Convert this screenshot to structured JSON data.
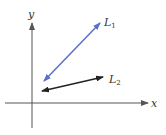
{
  "diagram": {
    "type": "coordinate-lines",
    "axes": {
      "x_label": "x",
      "y_label": "y",
      "color": "#555555"
    },
    "lines": [
      {
        "id": "L1",
        "name": "L",
        "subscript": "1",
        "color": "#5b6fc6",
        "from": [
          44,
          81
        ],
        "to": [
          100,
          23
        ],
        "double_headed": true
      },
      {
        "id": "L2",
        "name": "L",
        "subscript": "2",
        "color": "#222222",
        "from": [
          42,
          91
        ],
        "to": [
          103,
          77
        ],
        "double_headed": true
      }
    ]
  }
}
